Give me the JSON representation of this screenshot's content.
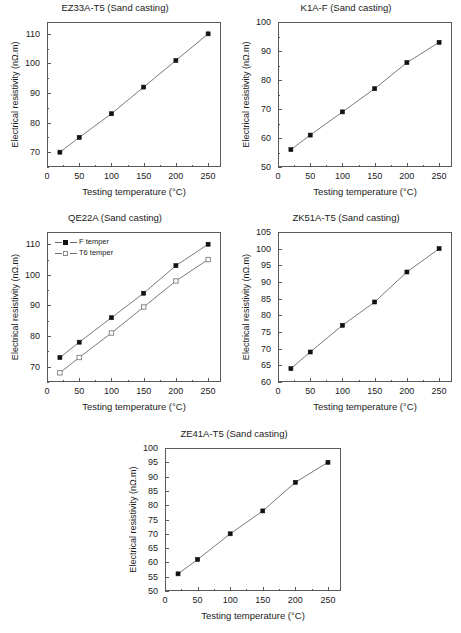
{
  "figure": {
    "axis_labels": {
      "x": "Testing temperature (°C)",
      "y": "Electrical resistivity (nΩ.m)"
    },
    "marker_color": "#111111",
    "line_color": "#6b6b6b",
    "axis_color": "#5a5a5a"
  },
  "chart_data": [
    {
      "id": "ez33a",
      "type": "line",
      "title": "EZ33A-T5 (Sand casting)",
      "xlabel": "Testing temperature (°C)",
      "ylabel": "Electrical resistivity (nΩ.m)",
      "x": [
        20,
        50,
        100,
        150,
        200,
        250
      ],
      "values": [
        70,
        75,
        83,
        92,
        101,
        110
      ],
      "xlim": [
        0,
        270
      ],
      "ylim": [
        65,
        114
      ],
      "xticks": [
        0,
        50,
        100,
        150,
        200,
        250
      ],
      "xticklabels": [
        "0",
        "50",
        "100",
        "150",
        "200",
        "250"
      ],
      "yticks": [
        70,
        80,
        90,
        100,
        110
      ],
      "yticklabels": [
        "70",
        "80",
        "90",
        "100",
        "110"
      ],
      "yminorstep": 5,
      "xminorstep": 25,
      "grid": false,
      "legend": null
    },
    {
      "id": "k1af",
      "type": "line",
      "title": "K1A-F (Sand casting)",
      "xlabel": "Testing temperature (°C)",
      "ylabel": "Electrical resistivity (nΩ.m)",
      "x": [
        20,
        50,
        100,
        150,
        200,
        250
      ],
      "values": [
        56,
        61,
        69,
        77,
        86,
        93
      ],
      "xlim": [
        0,
        270
      ],
      "ylim": [
        50,
        100
      ],
      "xticks": [
        0,
        50,
        100,
        150,
        200,
        250
      ],
      "xticklabels": [
        "0",
        "50",
        "100",
        "150",
        "200",
        "250"
      ],
      "yticks": [
        50,
        60,
        70,
        80,
        90,
        100
      ],
      "yticklabels": [
        "50",
        "60",
        "70",
        "80",
        "90",
        "100"
      ],
      "yminorstep": 5,
      "xminorstep": 25,
      "grid": false,
      "legend": null
    },
    {
      "id": "qe22a",
      "type": "line",
      "title": "QE22A (Sand casting)",
      "xlabel": "Testing temperature (°C)",
      "ylabel": "Electrical resistivity (nΩ.m)",
      "x": [
        20,
        50,
        100,
        150,
        200,
        250
      ],
      "series": [
        {
          "name": "F temper",
          "marker": "filled-square",
          "values": [
            73,
            78,
            86,
            94,
            103,
            110
          ]
        },
        {
          "name": "T6 temper",
          "marker": "open-square",
          "values": [
            68,
            73,
            81,
            89.5,
            98,
            105
          ]
        }
      ],
      "xlim": [
        0,
        270
      ],
      "ylim": [
        65,
        114
      ],
      "xticks": [
        0,
        50,
        100,
        150,
        200,
        250
      ],
      "xticklabels": [
        "0",
        "50",
        "100",
        "150",
        "200",
        "250"
      ],
      "yticks": [
        70,
        80,
        90,
        100,
        110
      ],
      "yticklabels": [
        "70",
        "80",
        "90",
        "100",
        "110"
      ],
      "yminorstep": 5,
      "xminorstep": 25,
      "grid": false,
      "legend": {
        "position": "top-left",
        "entries": [
          "F temper",
          "T6 temper"
        ]
      }
    },
    {
      "id": "zk51a",
      "type": "line",
      "title": "ZK51A-T5 (Sand casting)",
      "xlabel": "Testing temperature (°C)",
      "ylabel": "Electrical resistivity (nΩ.m)",
      "x": [
        20,
        50,
        100,
        150,
        200,
        250
      ],
      "values": [
        64,
        69,
        77,
        84,
        93,
        100
      ],
      "xlim": [
        0,
        270
      ],
      "ylim": [
        60,
        105
      ],
      "xticks": [
        0,
        50,
        100,
        150,
        200,
        250
      ],
      "xticklabels": [
        "0",
        "50",
        "100",
        "150",
        "200",
        "250"
      ],
      "yticks": [
        60,
        65,
        70,
        75,
        80,
        85,
        90,
        95,
        100,
        105
      ],
      "yticklabels": [
        "60",
        "65",
        "70",
        "75",
        "80",
        "85",
        "90",
        "95",
        "100",
        "105"
      ],
      "yminorstep": 0,
      "xminorstep": 25,
      "grid": false,
      "legend": null
    },
    {
      "id": "ze41a",
      "type": "line",
      "title": "ZE41A-T5 (Sand casting)",
      "xlabel": "Testing temperature (°C)",
      "ylabel": "Electrical resistivity (nΩ.m)",
      "x": [
        20,
        50,
        100,
        150,
        200,
        250
      ],
      "values": [
        56,
        61,
        70,
        78,
        88,
        95
      ],
      "xlim": [
        0,
        270
      ],
      "ylim": [
        50,
        100
      ],
      "xticks": [
        0,
        50,
        100,
        150,
        200,
        250
      ],
      "xticklabels": [
        "0",
        "50",
        "100",
        "150",
        "200",
        "250"
      ],
      "yticks": [
        50,
        55,
        60,
        65,
        70,
        75,
        80,
        85,
        90,
        95,
        100
      ],
      "yticklabels": [
        "50",
        "55",
        "60",
        "65",
        "70",
        "75",
        "80",
        "85",
        "90",
        "95",
        "100"
      ],
      "yminorstep": 0,
      "xminorstep": 25,
      "grid": false,
      "legend": null
    }
  ]
}
